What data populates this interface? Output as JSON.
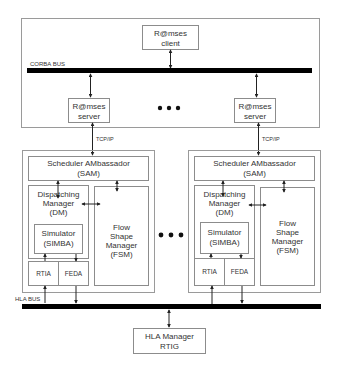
{
  "diagram": {
    "buses": {
      "corba": {
        "label": "CORBA BUS"
      },
      "hla": {
        "label": "HLA BUS"
      }
    },
    "client": {
      "line1": "R@mses",
      "line2": "client"
    },
    "servers": [
      {
        "line1": "R@mses",
        "line2": "server"
      },
      {
        "line1": "R@mses",
        "line2": "server"
      }
    ],
    "network_label": "TCP/IP",
    "ellipsis": "•••",
    "modules": [
      {
        "sam": {
          "line1": "Scheduler AMbassador",
          "line2": "(SAM)"
        },
        "dm": {
          "line1": "Dispatching",
          "line2": "Manager",
          "line3": "(DM)"
        },
        "simulator": {
          "line1": "Simulator",
          "line2": "(SIMBA)"
        },
        "fsm": {
          "line1": "Flow",
          "line2": "Shape",
          "line3": "Manager",
          "line4": "(FSM)"
        },
        "rtia": "RTIA",
        "feda": "FEDA"
      },
      {
        "sam": {
          "line1": "Scheduler AMbassador",
          "line2": "(SAM)"
        },
        "dm": {
          "line1": "Dispatching",
          "line2": "Manager",
          "line3": "(DM)"
        },
        "simulator": {
          "line1": "Simulator",
          "line2": "(SIMBA)"
        },
        "fsm": {
          "line1": "Flow",
          "line2": "Shape",
          "line3": "Manager",
          "line4": "(FSM)"
        },
        "rtia": "RTIA",
        "feda": "FEDA"
      }
    ],
    "hla_manager": {
      "line1": "HLA Manager",
      "line2": "RTIG"
    },
    "colors": {
      "bus": "#000000",
      "box_stroke": "#8c8c8c",
      "text": "#333333"
    }
  }
}
